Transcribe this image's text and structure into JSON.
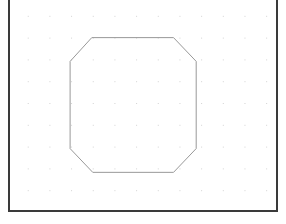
{
  "canvas": {
    "name": "drawing-canvas",
    "background_color": "#ffffff",
    "frame_color": "#3a3a3a",
    "frame_border_width_px": 2,
    "frame_bounds": {
      "left": 8,
      "top": -4,
      "width": 270,
      "height": 216
    },
    "frame_edges_drawn": [
      "left",
      "right",
      "bottom"
    ],
    "top_edge_clipped": true
  },
  "grid": {
    "name": "dot-grid",
    "visible": true,
    "style": "dots",
    "dot_color": "#d2d2d2",
    "dot_size_px": 1,
    "spacing_px": 22,
    "origin": {
      "x": 26,
      "y": 16
    },
    "columns": 12,
    "rows": 9
  },
  "chart_data": {
    "type": "scatter",
    "title": "",
    "xlabel": "",
    "ylabel": "",
    "xlim": [
      8,
      278
    ],
    "ylim": [
      0,
      212
    ],
    "grid": true,
    "legend": null,
    "shapes": [
      {
        "name": "octagon",
        "type": "polygon",
        "sides": 8,
        "stroke": "#969696",
        "stroke_width": 1,
        "fill": "none",
        "closed": true,
        "bounding_box": {
          "x": 69,
          "y": 38,
          "width": 128,
          "height": 136
        },
        "vertices": [
          {
            "x": 91,
            "y": 38
          },
          {
            "x": 174,
            "y": 38
          },
          {
            "x": 197,
            "y": 62
          },
          {
            "x": 197,
            "y": 150
          },
          {
            "x": 174,
            "y": 174
          },
          {
            "x": 92,
            "y": 174
          },
          {
            "x": 69,
            "y": 150
          },
          {
            "x": 69,
            "y": 62
          }
        ]
      }
    ]
  }
}
